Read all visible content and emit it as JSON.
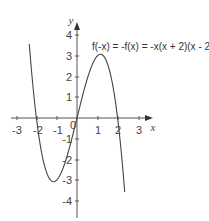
{
  "chart_data": {
    "type": "line",
    "title": "",
    "annotation": "f(-x) = -f(x) = -x(x + 2)(x - 2)",
    "xlabel": "x",
    "ylabel": "y",
    "xlim": [
      -3.5,
      3.7
    ],
    "ylim": [
      -4.4,
      4.6
    ],
    "grid": false,
    "legend": "none",
    "x_ticks": [
      -3,
      -2,
      -1,
      0,
      1,
      2,
      3
    ],
    "x_tick_labels": [
      "-3",
      "-2",
      "-1",
      "0",
      "1",
      "2",
      "3"
    ],
    "y_ticks": [
      -4,
      -3,
      -2,
      -1,
      1,
      2,
      3,
      4
    ],
    "y_tick_labels": [
      "-4",
      "-3",
      "-2",
      "-1",
      "1",
      "2",
      "3",
      "4"
    ],
    "series": [
      {
        "name": "f(x) = -x(x + 2)(x - 2)",
        "x": [
          -2.35,
          -2.2,
          -2.0,
          -1.8,
          -1.6,
          -1.4,
          -1.155,
          -1.0,
          -0.8,
          -0.6,
          -0.4,
          -0.2,
          0.0,
          0.2,
          0.4,
          0.6,
          0.8,
          1.0,
          1.155,
          1.4,
          1.6,
          1.8,
          2.0,
          2.2,
          2.35
        ],
        "y": [
          3.58,
          1.85,
          0.0,
          -1.37,
          -2.3,
          -2.86,
          -3.08,
          -3.0,
          -2.69,
          -2.18,
          -1.54,
          -0.79,
          0.0,
          0.79,
          1.54,
          2.18,
          2.69,
          3.0,
          3.08,
          2.86,
          2.3,
          1.37,
          0.0,
          -1.85,
          -3.58
        ]
      }
    ],
    "key_points": {
      "roots": [
        -2,
        0,
        2
      ],
      "local_max": [
        1.155,
        3.08
      ],
      "local_min": [
        -1.155,
        -3.08
      ]
    }
  },
  "labels": {
    "x_axis": "x",
    "y_axis": "y",
    "equation": "f(-x) = -f(x) = -x(x + 2)(x - 2)",
    "origin": "0",
    "x_ticks": [
      "-3",
      "-2",
      "-1",
      "1",
      "2",
      "3"
    ],
    "y_ticks": [
      "4",
      "3",
      "2",
      "1",
      "-1",
      "-2",
      "-3",
      "-4"
    ]
  }
}
